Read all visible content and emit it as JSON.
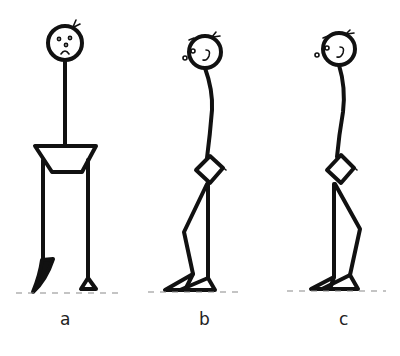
{
  "figure": {
    "panels": [
      {
        "id": "a",
        "label": "a",
        "view": "front",
        "expression": "frowning"
      },
      {
        "id": "b",
        "label": "b",
        "view": "side",
        "expression": "neutral"
      },
      {
        "id": "c",
        "label": "c",
        "view": "side",
        "expression": "neutral"
      }
    ]
  },
  "colors": {
    "ink": "#111111",
    "ground": "#8a8a8a",
    "background": "#ffffff"
  }
}
